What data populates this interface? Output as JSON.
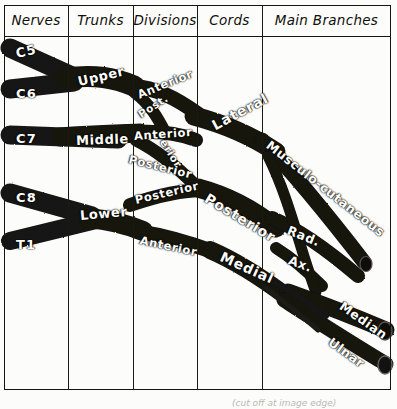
{
  "figure": {
    "type": "anatomical-schematic-table",
    "bottom_caption": "(cut off at image edge)"
  },
  "table": {
    "columns": [
      {
        "label": "Nerves",
        "x": 4,
        "width": 64
      },
      {
        "label": "Trunks",
        "x": 68,
        "width": 65
      },
      {
        "label": "Divisions",
        "x": 133,
        "width": 64
      },
      {
        "label": "Cords",
        "x": 197,
        "width": 65
      },
      {
        "label": "Main Branches",
        "x": 262,
        "width": 129
      }
    ],
    "frame": {
      "x": 4,
      "y": 5,
      "width": 387,
      "height": 385
    },
    "header_rule_y": 36
  },
  "roots": [
    {
      "label": "C5",
      "x": 16,
      "y": 46,
      "rotate": -13
    },
    {
      "label": "C6",
      "x": 16,
      "y": 86,
      "rotate": 0
    },
    {
      "label": "C7",
      "x": 16,
      "y": 131,
      "rotate": 0
    },
    {
      "label": "C8",
      "x": 16,
      "y": 190,
      "rotate": 0
    },
    {
      "label": "T1",
      "x": 16,
      "y": 237,
      "rotate": 0
    }
  ],
  "trunks": [
    {
      "label": "Upper",
      "x": 78,
      "y": 74,
      "rotate": -13
    },
    {
      "label": "Middle",
      "x": 76,
      "y": 133,
      "rotate": -2
    },
    {
      "label": "Lower",
      "x": 80,
      "y": 208,
      "rotate": -5
    }
  ],
  "divisions": [
    {
      "label": "Anterior",
      "x": 138,
      "y": 88,
      "rotate": -22
    },
    {
      "label": "Post.",
      "x": 139,
      "y": 109,
      "rotate": -33
    },
    {
      "label": "Anterior",
      "x": 134,
      "y": 129,
      "rotate": -4
    },
    {
      "label": "erior",
      "x": 163,
      "y": 134,
      "rotate": 58
    },
    {
      "label": "Posterior",
      "x": 129,
      "y": 152,
      "rotate": 14
    },
    {
      "label": "Posterior",
      "x": 135,
      "y": 193,
      "rotate": -13
    },
    {
      "label": "Anterior",
      "x": 140,
      "y": 233,
      "rotate": 12
    }
  ],
  "cords": [
    {
      "label": "Lateral",
      "x": 213,
      "y": 118,
      "rotate": -28
    },
    {
      "label": "Posterior",
      "x": 206,
      "y": 189,
      "rotate": 31
    },
    {
      "label": "Medial",
      "x": 221,
      "y": 248,
      "rotate": 24
    }
  ],
  "branches": [
    {
      "label": "Musculo-cutaneous",
      "x": 268,
      "y": 136,
      "rotate": 38
    },
    {
      "label": "Rad.",
      "x": 288,
      "y": 222,
      "rotate": 22
    },
    {
      "label": "Ax.",
      "x": 289,
      "y": 252,
      "rotate": 20
    },
    {
      "label": "Median",
      "x": 341,
      "y": 297,
      "rotate": 35
    },
    {
      "label": "Ulnar",
      "x": 330,
      "y": 333,
      "rotate": 36
    }
  ],
  "colors": {
    "ink": "#15140f",
    "paper": "#fcfcfa",
    "nerve": "#141310",
    "label_text": "#fdfdfa"
  }
}
